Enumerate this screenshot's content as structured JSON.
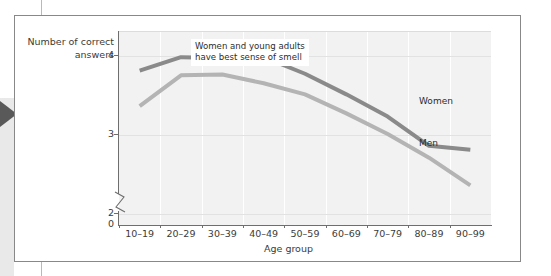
{
  "figure": {
    "annotation": "Women and young adults\nhave best sense of smell",
    "left_tab_marker": "triangle-marker"
  },
  "chart_data": {
    "type": "line",
    "title": "",
    "xlabel": "Age group",
    "ylabel": "Number of correct answers",
    "categories": [
      "10–19",
      "20–29",
      "30–39",
      "40–49",
      "50–59",
      "60–69",
      "70–79",
      "80–89",
      "90–99"
    ],
    "series": [
      {
        "name": "Women",
        "color": "#8a8a8a",
        "values": [
          3.8,
          3.97,
          3.96,
          3.97,
          3.76,
          3.5,
          3.22,
          2.85,
          2.8
        ]
      },
      {
        "name": "Men",
        "color": "#b4b4b4",
        "values": [
          3.35,
          3.74,
          3.75,
          3.64,
          3.5,
          3.26,
          3.0,
          2.7,
          2.35
        ]
      }
    ],
    "yticks": [
      0,
      2,
      3,
      4
    ],
    "ytick_labels": [
      "0",
      "2",
      "3",
      "4"
    ],
    "ylim": [
      1.85,
      4.3
    ],
    "y_axis_break": true,
    "grid": "both",
    "legend_position": "inline-labels",
    "plot_background": "#f2f2f2",
    "gridline_color": "#ffffff",
    "axis_color": "#6e6e6e"
  }
}
